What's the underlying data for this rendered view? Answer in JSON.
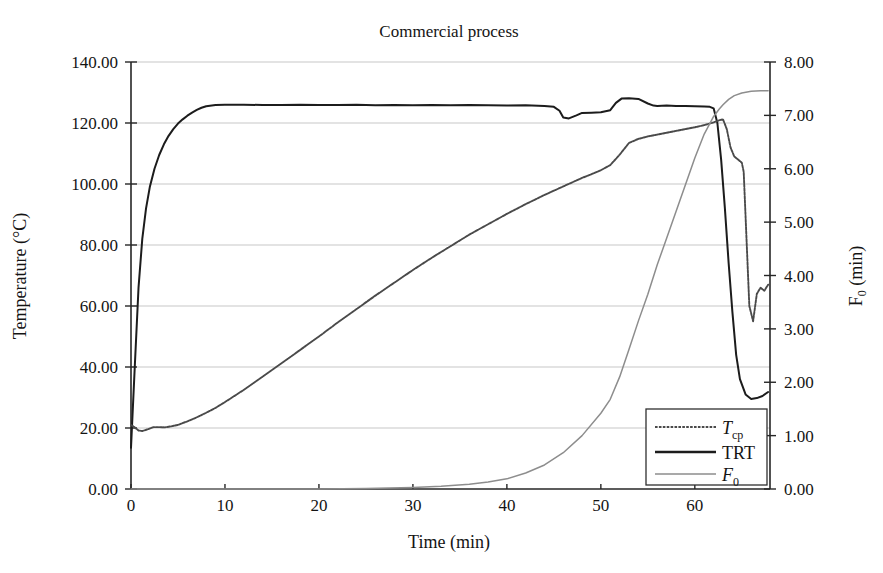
{
  "figure": {
    "title": "Commercial process",
    "background": "#ffffff",
    "width": 883,
    "height": 573
  },
  "axes": {
    "left": {
      "label": "Temperature (°C)",
      "ticks": [
        "0.00",
        "20.00",
        "40.00",
        "60.00",
        "80.00",
        "100.00",
        "120.00",
        "140.00"
      ],
      "min": 0,
      "max": 140
    },
    "right": {
      "label_main": "F",
      "label_sub": "0",
      "label_tail": " (min)",
      "ticks": [
        "0.00",
        "1.00",
        "2.00",
        "3.00",
        "4.00",
        "5.00",
        "6.00",
        "7.00",
        "8.00"
      ],
      "min": 0,
      "max": 8
    },
    "bottom": {
      "label": "Time (min)",
      "ticks": [
        "0",
        "10",
        "20",
        "30",
        "40",
        "50",
        "60"
      ],
      "min": 0,
      "max": 68
    }
  },
  "legend": {
    "entries": [
      {
        "name": "T_cp",
        "main": "T",
        "sub": "cp",
        "style": "dotted",
        "color": "#4a4a4a"
      },
      {
        "name": "TRT",
        "main": "TRT",
        "sub": "",
        "style": "solid",
        "color": "#1c1c1c"
      },
      {
        "name": "F_0",
        "main": "F",
        "sub": "0",
        "style": "thin",
        "color": "#8d8d8d"
      }
    ]
  },
  "chart_data": {
    "type": "line",
    "title": "Commercial process",
    "xlabel": "Time (min)",
    "ylabel": "Temperature (°C)",
    "y2label": "F0 (min)",
    "xlim": [
      0,
      68
    ],
    "ylim": [
      0,
      140
    ],
    "y2lim": [
      0,
      8
    ],
    "grid": true,
    "legend_position": "bottom-right",
    "series": [
      {
        "name": "TRT",
        "axis": "left",
        "units": "°C",
        "style": "solid",
        "x": [
          0,
          0.4,
          0.8,
          1.2,
          1.6,
          2,
          2.5,
          3,
          3.5,
          4,
          4.5,
          5,
          5.5,
          6,
          6.5,
          7,
          7.5,
          8,
          9,
          10,
          12,
          14,
          16,
          18,
          20,
          22,
          24,
          26,
          28,
          30,
          32,
          34,
          36,
          38,
          40,
          42,
          44,
          45,
          45.6,
          46,
          46.6,
          47.4,
          48,
          49,
          50,
          51,
          51.6,
          52.2,
          53,
          54,
          55,
          55.6,
          56,
          57,
          58,
          59,
          60,
          61,
          61.6,
          62,
          62.4,
          62.8,
          63.2,
          63.6,
          64,
          64.4,
          64.8,
          65.4,
          66,
          66.6,
          67.2,
          67.8
        ],
        "y": [
          13.5,
          40,
          66,
          82,
          92,
          99,
          105,
          109.5,
          113,
          115.8,
          118,
          119.8,
          121.2,
          122.4,
          123.4,
          124.3,
          125,
          125.5,
          125.9,
          126,
          126,
          125.9,
          125.9,
          126,
          125.9,
          125.9,
          126,
          125.8,
          125.9,
          125.8,
          125.9,
          125.8,
          125.9,
          125.8,
          125.7,
          125.8,
          125.6,
          125.3,
          124,
          121.8,
          121.5,
          122.5,
          123.3,
          123.4,
          123.5,
          124.2,
          126.6,
          128,
          128.1,
          127.9,
          126.4,
          125.7,
          125.6,
          125.7,
          125.6,
          125.6,
          125.5,
          125.4,
          125.3,
          124.8,
          120,
          108,
          92,
          74,
          58,
          44,
          36,
          31,
          29.5,
          29.8,
          30.5,
          31.8
        ]
      },
      {
        "name": "T_cp",
        "axis": "left",
        "units": "°C",
        "style": "dotted",
        "x": [
          0,
          0.4,
          0.8,
          1.2,
          1.8,
          2.4,
          3,
          3.6,
          4.2,
          5,
          6,
          7,
          8,
          9,
          10,
          12,
          14,
          16,
          18,
          20,
          22,
          24,
          26,
          28,
          30,
          32,
          34,
          36,
          38,
          40,
          42,
          44,
          45,
          46,
          47,
          48,
          49,
          50,
          51,
          52,
          53,
          54,
          55,
          56,
          57,
          58,
          59,
          60,
          61,
          62,
          62.6,
          63,
          63.4,
          63.8,
          64.2,
          64.6,
          65,
          65.2,
          65.5,
          65.8,
          66.2,
          66.6,
          67,
          67.4,
          67.8
        ],
        "y": [
          21,
          20.2,
          19.2,
          19,
          19.6,
          20.3,
          20.3,
          20.2,
          20.5,
          21,
          22.2,
          23.5,
          25,
          26.6,
          28.5,
          32.5,
          36.8,
          41.2,
          45.6,
          50,
          54.6,
          59,
          63.4,
          67.6,
          71.8,
          75.8,
          79.6,
          83.4,
          86.8,
          90.2,
          93.4,
          96.4,
          97.8,
          99.2,
          100.6,
          102,
          103.2,
          104.5,
          106.2,
          109.6,
          113.5,
          114.8,
          115.6,
          116.2,
          116.8,
          117.4,
          118,
          118.6,
          119.3,
          120.2,
          120.9,
          121.2,
          118,
          112,
          109,
          108,
          107,
          104,
          82,
          60,
          55,
          64,
          66,
          65,
          67
        ]
      },
      {
        "name": "F0",
        "axis": "right",
        "units": "min",
        "style": "thin",
        "x": [
          0,
          5,
          10,
          15,
          20,
          25,
          30,
          33,
          36,
          38,
          40,
          42,
          44,
          46,
          48,
          50,
          51,
          52,
          53,
          54,
          55,
          56,
          57,
          58,
          59,
          60,
          61,
          62,
          62.6,
          63,
          63.6,
          64.2,
          65,
          66,
          67,
          67.8
        ],
        "y": [
          0,
          0,
          0,
          0,
          0,
          0.01,
          0.03,
          0.05,
          0.09,
          0.13,
          0.19,
          0.3,
          0.45,
          0.68,
          1.0,
          1.42,
          1.68,
          2.1,
          2.62,
          3.15,
          3.65,
          4.2,
          4.7,
          5.2,
          5.7,
          6.2,
          6.65,
          6.98,
          7.12,
          7.2,
          7.3,
          7.37,
          7.42,
          7.45,
          7.46,
          7.46
        ]
      }
    ]
  }
}
